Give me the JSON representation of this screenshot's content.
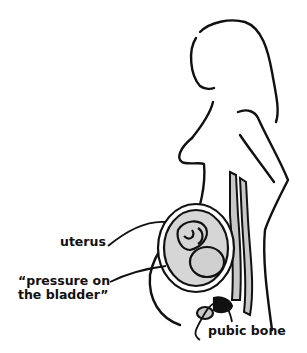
{
  "figure": {
    "colors": {
      "stroke": "#111111",
      "fill_gray": "#c8c8c8",
      "background": "#ffffff"
    },
    "labels": {
      "uterus": "uterus",
      "pressure_line1": "“pressure on",
      "pressure_line2": "the bladder”",
      "pubic_bone": "pubic bone"
    }
  }
}
